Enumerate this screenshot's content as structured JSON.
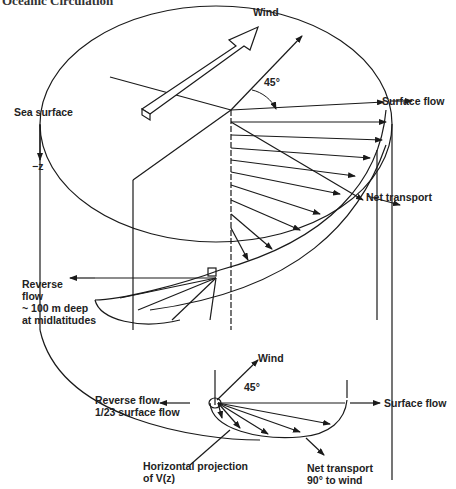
{
  "header": {
    "title": "Oceanic Circulation"
  },
  "labels": {
    "wind_top": "Wind",
    "angle_top": "45°",
    "surface_flow_top": "Surface flow",
    "net_transport_top": "Net transport",
    "sea_surface": "Sea surface",
    "z_axis": "−z",
    "reverse_flow_line1": "Reverse",
    "reverse_flow_line2": "flow",
    "reverse_flow_line3": "~ 100 m deep",
    "reverse_flow_line4": "at midlatitudes",
    "wind_bottom": "Wind",
    "angle_bottom": "45°",
    "reverse_flow_bottom_line1": "Reverse flow",
    "reverse_flow_bottom_line2": "1/23 surface flow",
    "surface_flow_bottom": "Surface flow",
    "horiz_proj_line1": "Horizontal projection",
    "horiz_proj_line2": "of V(z)",
    "net_transport_bottom_line1": "Net transport",
    "net_transport_bottom_line2": "90° to wind"
  },
  "colors": {
    "ink": "#1a1a1a",
    "background": "#ffffff"
  }
}
